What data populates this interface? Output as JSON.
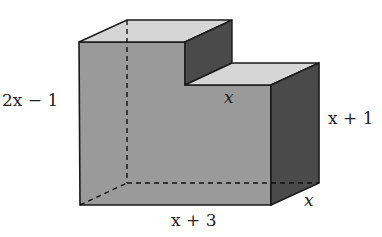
{
  "figure": {
    "type": "3D stepped solid (L-shaped prism)",
    "colors": {
      "front_face": "#9a9a9a",
      "top_face": "#d4d4d4",
      "side_face": "#4a4a4a",
      "edge": "#1a1a1a"
    }
  },
  "labels": {
    "height_left": "2x − 1",
    "step_width": "x",
    "right_height": "x + 1",
    "bottom_length": "x + 3",
    "depth": "x"
  }
}
